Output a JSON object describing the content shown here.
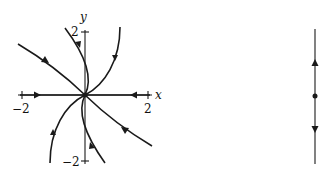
{
  "phase_portrait": {
    "x_axis_label": "x",
    "y_axis_label": "y",
    "x_tick_neg": "−2",
    "x_tick_pos": "2",
    "y_tick_pos": "2",
    "y_tick_neg": "−2",
    "equilibrium": "origin",
    "flow": "all trajectories approach origin (sink)"
  },
  "phase_line": {
    "equilibrium_marker": "dot",
    "arrows": [
      "up (above equilibrium)",
      "down (below equilibrium)"
    ]
  },
  "colors": {
    "ink": "#1a1a1a",
    "background": "#ffffff"
  }
}
